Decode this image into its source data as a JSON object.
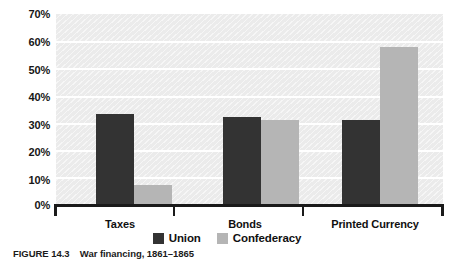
{
  "chart_data": {
    "type": "bar",
    "title": "",
    "xlabel": "",
    "ylabel": "",
    "ylim": [
      0,
      70
    ],
    "ytick_step": 10,
    "grid": true,
    "grid_orientation": "horizontal",
    "legend_position": "bottom-center",
    "categories": [
      "Taxes",
      "Bonds",
      "Printed Currency"
    ],
    "ytick_labels": [
      "70%",
      "60%",
      "50%",
      "40%",
      "30%",
      "20%",
      "10%",
      "0%"
    ],
    "ytick_values": [
      70,
      60,
      50,
      40,
      30,
      20,
      10,
      0
    ],
    "series": [
      {
        "name": "Union",
        "color": "#333333",
        "values": [
          33,
          32,
          31
        ]
      },
      {
        "name": "Confederacy",
        "color": "#b5b5b5",
        "values": [
          7,
          31,
          58
        ]
      }
    ]
  },
  "legend": {
    "items": [
      {
        "label": "Union",
        "color": "#333333"
      },
      {
        "label": "Confederacy",
        "color": "#b5b5b5"
      }
    ]
  },
  "caption": {
    "number": "FIGURE 14.3",
    "text": "War financing, 1861–1865"
  },
  "colors": {
    "plot_background": "#ebebeb",
    "gridline": "#ffffff",
    "axis": "#1a1a1a",
    "union": "#333333",
    "confederacy": "#b5b5b5",
    "text": "#101010"
  }
}
